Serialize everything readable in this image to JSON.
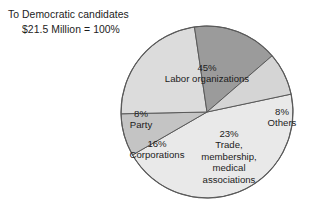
{
  "caption": {
    "line1": "To Democratic candidates",
    "total_amount": "$21.5 Million",
    "equals": "=",
    "total_percent": "100%"
  },
  "chart_data": {
    "type": "pie",
    "title": "To Democratic candidates",
    "subtitle": "$21.5 Million = 100%",
    "total_label": "$21.5 Million",
    "total_value_percent": 100,
    "units": "percent",
    "legend": "none",
    "labels_inside_slices": true,
    "categories": [
      "Labor organizations",
      "Others",
      "Trade, membership, medical associations",
      "Corporations",
      "Party"
    ],
    "values": [
      45,
      8,
      23,
      16,
      8
    ],
    "colors": [
      "#e9e9e9",
      "#c4c4c4",
      "#dcdcdc",
      "#9b9b9b",
      "#d5d5d5"
    ],
    "stroke_color": "#5a5a5a",
    "slices": [
      {
        "name": "Labor organizations",
        "percent_label": "45%",
        "value": 45,
        "color": "#e9e9e9",
        "label_lines": [
          "45%",
          "Labor organizations"
        ]
      },
      {
        "name": "Others",
        "percent_label": "8%",
        "value": 8,
        "color": "#c4c4c4",
        "label_lines": [
          "8%",
          "Others"
        ]
      },
      {
        "name": "Trade, membership, medical associations",
        "percent_label": "23%",
        "value": 23,
        "color": "#dcdcdc",
        "label_lines": [
          "23%",
          "Trade,",
          "membership,",
          "medical",
          "associations"
        ]
      },
      {
        "name": "Corporations",
        "percent_label": "16%",
        "value": 16,
        "color": "#9b9b9b",
        "label_lines": [
          "16%",
          "Corporations"
        ]
      },
      {
        "name": "Party",
        "percent_label": "8%",
        "value": 8,
        "color": "#d5d5d5",
        "label_lines": [
          "8%",
          "Party"
        ]
      }
    ]
  },
  "labels": {
    "labor": {
      "pct": "45%",
      "name": "Labor organizations"
    },
    "others": {
      "pct": "8%",
      "name": "Others"
    },
    "trade": {
      "pct": "23%",
      "line1": "Trade,",
      "line2": "membership,",
      "line3": "medical",
      "line4": "associations"
    },
    "corporations": {
      "pct": "16%",
      "name": "Corporations"
    },
    "party": {
      "pct": "8%",
      "name": "Party"
    }
  }
}
